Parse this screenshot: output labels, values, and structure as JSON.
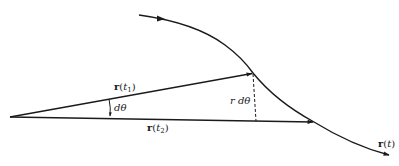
{
  "diagram": {
    "colors": {
      "ink": "#1a1a1a",
      "background": "#ffffff"
    },
    "labels": {
      "r_t1": {
        "vec": "r",
        "arg_open": "(",
        "var": "t",
        "sub": "1",
        "arg_close": ")"
      },
      "r_t2": {
        "vec": "r",
        "arg_open": "(",
        "var": "t",
        "sub": "2",
        "arg_close": ")"
      },
      "r_t": {
        "vec": "r",
        "arg_open": "(",
        "var": "t",
        "arg_close": ")"
      },
      "d_theta": "dθ",
      "r_d_theta": "r dθ"
    },
    "elements": [
      {
        "id": "origin",
        "type": "point",
        "x": 10,
        "y": 117
      },
      {
        "id": "vector-r-t1",
        "type": "arrow",
        "from": [
          10,
          117
        ],
        "to": [
          253,
          73
        ],
        "label": "r(t1)"
      },
      {
        "id": "vector-r-t2",
        "type": "arrow",
        "from": [
          10,
          117
        ],
        "to": [
          314,
          122
        ],
        "label": "r(t2)"
      },
      {
        "id": "curve-r-t",
        "type": "curve",
        "label": "r(t)",
        "direction": "left-to-right"
      },
      {
        "id": "arc-length-segment",
        "type": "dashed-line",
        "from": [
          253,
          73
        ],
        "to": [
          256,
          121
        ],
        "label": "r dθ"
      },
      {
        "id": "angle-d-theta",
        "type": "arc-arrow",
        "label": "dθ"
      }
    ]
  }
}
